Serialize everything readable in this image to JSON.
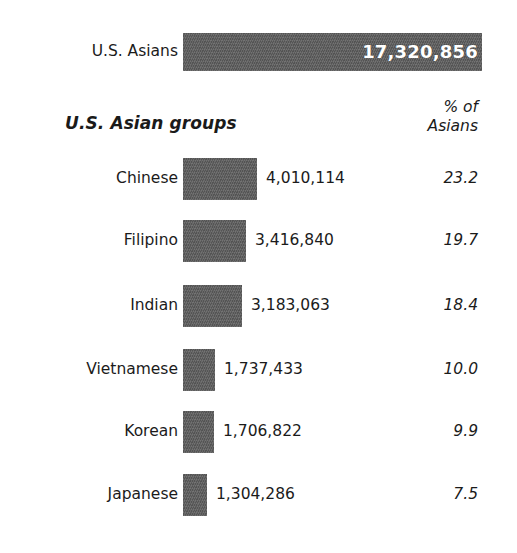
{
  "total": {
    "label": "U.S. Asians",
    "value": "17,320,856",
    "value_number": 17320856
  },
  "header": {
    "groups_title": "U.S. Asian groups",
    "pct_line1": "% of",
    "pct_line2": "Asians"
  },
  "colors": {
    "bar": "#5e5e5e",
    "background": "#ffffff",
    "text": "#1b1b1b",
    "total_value_text": "#ffffff"
  },
  "rows": [
    {
      "label": "Chinese",
      "value": "4,010,114",
      "value_number": 4010114,
      "percent": "23.2"
    },
    {
      "label": "Filipino",
      "value": "3,416,840",
      "value_number": 3416840,
      "percent": "19.7"
    },
    {
      "label": "Indian",
      "value": "3,183,063",
      "value_number": 3183063,
      "percent": "18.4"
    },
    {
      "label": "Vietnamese",
      "value": "1,737,433",
      "value_number": 1737433,
      "percent": "10.0"
    },
    {
      "label": "Korean",
      "value": "1,706,822",
      "value_number": 1706822,
      "percent": "9.9"
    },
    {
      "label": "Japanese",
      "value": "1,304,286",
      "value_number": 1304286,
      "percent": "7.5"
    }
  ],
  "chart_data": {
    "type": "bar",
    "title": "U.S. Asian groups",
    "orientation": "horizontal",
    "categories": [
      "Chinese",
      "Filipino",
      "Indian",
      "Vietnamese",
      "Korean",
      "Japanese"
    ],
    "values": [
      4010114,
      3416840,
      3183063,
      1737433,
      1706822,
      1304286
    ],
    "value_labels": [
      "4,010,114",
      "3,416,840",
      "3,183,063",
      "1,737,433",
      "1,706,822",
      "1,304,286"
    ],
    "percent_of_asians": [
      23.2,
      19.7,
      18.4,
      10.0,
      9.9,
      7.5
    ],
    "total_category": "U.S. Asians",
    "total_value": 17320856,
    "total_value_label": "17,320,856",
    "xlabel": "",
    "ylabel": "",
    "grid": false,
    "legend": null,
    "series_color": "#5e5e5e",
    "pixel_bar_widths": {
      "total": 299,
      "Chinese": 74,
      "Filipino": 63,
      "Indian": 59,
      "Vietnamese": 32,
      "Korean": 31,
      "Japanese": 24
    }
  },
  "layout": {
    "bar_left_px": 183,
    "label_right_px": 178,
    "percent_right_px": 478,
    "row_tops_px": [
      158,
      220,
      285,
      349,
      411,
      474
    ],
    "row_bar_height_px": 42,
    "value_gap_px": 9
  }
}
